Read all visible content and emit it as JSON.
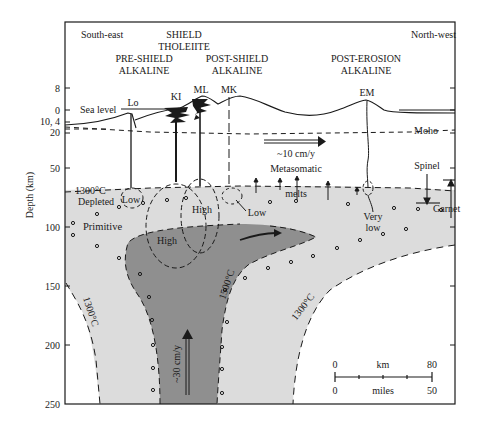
{
  "figure": {
    "type": "cross-section diagram",
    "directions": {
      "left": "South-east",
      "right": "North-west"
    },
    "y_axis": {
      "label": "Depth (km)",
      "ticks": [
        "8",
        "0",
        "10, 4",
        "20",
        "50",
        "100",
        "150",
        "200",
        "250"
      ]
    },
    "volcano_stages": [
      {
        "line1": "PRE-SHIELD",
        "line2": "ALKALINE"
      },
      {
        "line1": "SHIELD",
        "line2": "THOLEIITE"
      },
      {
        "line1": "POST-SHIELD",
        "line2": "ALKALINE"
      },
      {
        "line1": "POST-EROSION",
        "line2": "ALKALINE"
      }
    ],
    "volcanoes": [
      "Lo",
      "KI",
      "ML",
      "MK",
      "EM"
    ],
    "surface_labels": {
      "sea_level": "Sea level",
      "moho": "Moho"
    },
    "plate_motion": "~10 cm/y",
    "plume_velocity": "~30 cm/y",
    "regions": {
      "depleted": "Depleted",
      "primitive": "Primitive",
      "isotherm_top": "1300°C",
      "isotherm_left": "1300°C",
      "isotherm_inner": "1500°C",
      "isotherm_right": "1300°C"
    },
    "melt_zones": {
      "lo": "Low",
      "ki": "High",
      "ml": "High",
      "mk": "Low",
      "em_line1": "Very",
      "em_line2": "low"
    },
    "metasomatic": {
      "line1": "Metasomatic",
      "line2": "melts"
    },
    "phase_labels": {
      "spinel": "Spinel",
      "garnet": "Garnet"
    },
    "scale_bar": {
      "km_label": "km",
      "km_start": "0",
      "km_end": "80",
      "miles_label": "miles",
      "miles_start": "0",
      "miles_end": "50"
    },
    "colors": {
      "plume_core": "#8f8f8f",
      "hot_mantle": "#dcdcdc",
      "line": "#1a1a1a",
      "background": "#ffffff"
    }
  }
}
